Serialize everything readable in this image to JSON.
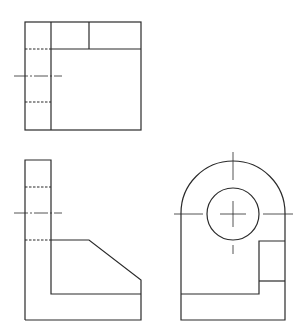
{
  "drawing": {
    "type": "orthographic-projection",
    "views": [
      {
        "name": "top-view",
        "label": ""
      },
      {
        "name": "side-view",
        "label": ""
      },
      {
        "name": "front-view",
        "label": ""
      }
    ],
    "colors": {
      "line": "#2a2a2a",
      "background": "#ffffff"
    }
  }
}
